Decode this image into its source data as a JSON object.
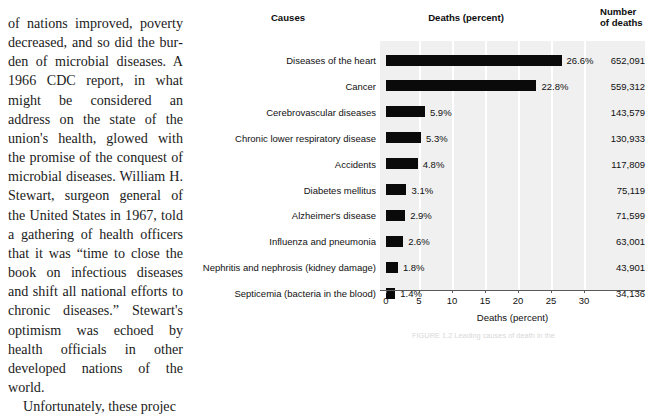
{
  "article": {
    "paragraph_continued": "of nations improved, poverty decreased, and so did the bur­den of microbial diseases. A 1966 CDC report, in what might be considered an address on the state of the union's health, glowed with the promise of the conquest of microbial diseases. William H. Stewart, surgeon general of the United States in 1967, told a gathering of health officers that it was “time to close the book on infectious diseases and shift all national efforts to chronic diseases.” Stewart's opti­mism was echoed by health of­ficials in other developed nations of the world.",
    "paragraph_next": "Unfortunately, these projec"
  },
  "figure": {
    "caption": "FIGURE 1.2   Leading causes of death in the"
  },
  "chart_data": {
    "type": "bar",
    "orientation": "horizontal",
    "title": "",
    "headers": {
      "causes": "Causes",
      "deaths_percent": "Deaths (percent)",
      "number_of_deaths": "Number\nof deaths"
    },
    "categories": [
      "Diseases of the heart",
      "Cancer",
      "Cerebrovascular diseases",
      "Chronic lower respiratory disease",
      "Accidents",
      "Diabetes mellitus",
      "Alzheimer's disease",
      "Influenza and pneumonia",
      "Nephritis and nephrosis (kidney damage)",
      "Septicemia (bacteria in the blood)"
    ],
    "values": [
      26.6,
      22.8,
      5.9,
      5.3,
      4.8,
      3.1,
      2.9,
      2.6,
      1.8,
      1.4
    ],
    "value_labels": [
      "26.6%",
      "22.8%",
      "5.9%",
      "5.3%",
      "4.8%",
      "3.1%",
      "2.9%",
      "2.6%",
      "1.8%",
      "1.4%"
    ],
    "counts": [
      652091,
      559312,
      143579,
      130933,
      117809,
      75119,
      71599,
      63001,
      43901,
      34136
    ],
    "count_labels": [
      "652,091",
      "559,312",
      "143,579",
      "130,933",
      "117,809",
      "75,119",
      "71,599",
      "63,001",
      "43,901",
      "34,136"
    ],
    "xlabel": "Deaths (percent)",
    "ylabel": "",
    "xlim": [
      0,
      30
    ],
    "xticks": [
      0,
      5,
      10,
      15,
      20,
      25,
      30
    ],
    "xtick_labels": [
      "0",
      "5",
      "10",
      "15",
      "20",
      "25",
      "30"
    ],
    "grid": "vertical-only",
    "legend": "none",
    "colors": {
      "bar": "#0a0a0a",
      "plot_background": "#f0f0f0",
      "gridline": "#ffffff",
      "text": "#111111"
    }
  }
}
